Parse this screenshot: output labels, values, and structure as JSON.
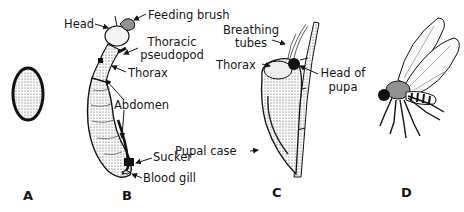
{
  "figure": {
    "panels": [
      {
        "id": "A",
        "label": "A",
        "subject": "egg"
      },
      {
        "id": "B",
        "label": "B",
        "subject": "larva"
      },
      {
        "id": "C",
        "label": "C",
        "subject": "pupa"
      },
      {
        "id": "D",
        "label": "D",
        "subject": "adult fly"
      }
    ],
    "callouts": {
      "head": "Head",
      "feeding_brush": "Feeding brush",
      "thoracic_pseudopod_1": "Thoracic",
      "thoracic_pseudopod_2": "pseudopod",
      "thorax_larva": "Thorax",
      "abdomen": "Abdomen",
      "sucker": "Sucker",
      "blood_gill": "Blood gill",
      "breathing_tubes_1": "Breathing",
      "breathing_tubes_2": "tubes",
      "thorax_pupa": "Thorax",
      "head_of_pupa_1": "Head of",
      "head_of_pupa_2": "pupa",
      "pupal_case": "Pupal case"
    },
    "caption": ""
  },
  "colors": {
    "ink": "#151515",
    "background": "#ffffff",
    "shade": "#9a9a9a"
  }
}
